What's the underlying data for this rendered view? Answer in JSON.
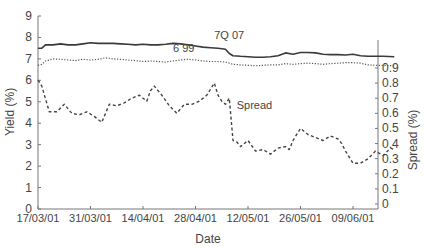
{
  "chart_data": {
    "type": "line",
    "title": "",
    "xlabel": "Date",
    "ylabel": "Yield (%)",
    "y2label": "Spread (%)",
    "ylim": [
      0,
      9
    ],
    "y2lim": [
      0,
      0.9
    ],
    "yticks": [
      "0",
      "1",
      "2",
      "3",
      "4",
      "5",
      "6",
      "7",
      "8",
      "9"
    ],
    "y2ticks": [
      "0",
      "0.1",
      "0.2",
      "0.3",
      "0.4",
      "0.5",
      "0.6",
      "0.7",
      "0.8",
      "0.9"
    ],
    "xticks": [
      "17/03/01",
      "31/03/01",
      "14/04/01",
      "28/04/01",
      "12/05/01",
      "26/05/01",
      "09/06/01"
    ],
    "x_day_range": [
      0,
      95
    ],
    "grid": false,
    "legend_position": "inline labels",
    "series": [
      {
        "name": "7Q 07",
        "axis": "left",
        "style": "solid",
        "label_pos": {
          "day": 47,
          "value": 7.95
        },
        "x": [
          0,
          1,
          2,
          4,
          6,
          8,
          10,
          12,
          14,
          16,
          18,
          20,
          22,
          24,
          26,
          28,
          30,
          32,
          34,
          36,
          38,
          40,
          42,
          44,
          46,
          48,
          50,
          51,
          52,
          54,
          56,
          58,
          60,
          62,
          64,
          66,
          68,
          70,
          72,
          74,
          76,
          78,
          80,
          82,
          84,
          86,
          88,
          90,
          92,
          95
        ],
        "values": [
          7.5,
          7.5,
          7.65,
          7.65,
          7.7,
          7.65,
          7.65,
          7.7,
          7.75,
          7.72,
          7.72,
          7.72,
          7.7,
          7.68,
          7.65,
          7.68,
          7.65,
          7.65,
          7.68,
          7.72,
          7.7,
          7.65,
          7.6,
          7.55,
          7.52,
          7.5,
          7.45,
          7.25,
          7.15,
          7.12,
          7.1,
          7.08,
          7.08,
          7.1,
          7.15,
          7.28,
          7.22,
          7.3,
          7.3,
          7.28,
          7.22,
          7.2,
          7.2,
          7.18,
          7.22,
          7.15,
          7.12,
          7.12,
          7.12,
          7.1
        ]
      },
      {
        "name": "6 99",
        "axis": "left",
        "style": "dotted",
        "label_pos": {
          "day": 36,
          "value": 7.3
        },
        "x": [
          0,
          1,
          2,
          4,
          6,
          8,
          10,
          12,
          14,
          16,
          18,
          20,
          22,
          24,
          26,
          28,
          30,
          32,
          34,
          36,
          38,
          40,
          42,
          44,
          46,
          48,
          50,
          51,
          52,
          54,
          56,
          58,
          60,
          62,
          64,
          66,
          68,
          70,
          72,
          74,
          76,
          78,
          80,
          82,
          84,
          86,
          88,
          90,
          92,
          95
        ],
        "values": [
          6.7,
          6.75,
          6.9,
          7.0,
          6.98,
          6.95,
          6.92,
          6.98,
          6.95,
          6.98,
          7.05,
          7.0,
          6.98,
          6.95,
          6.92,
          6.88,
          6.9,
          6.88,
          6.85,
          6.9,
          6.95,
          6.98,
          6.95,
          6.9,
          6.88,
          6.88,
          6.85,
          6.8,
          6.75,
          6.72,
          6.7,
          6.68,
          6.7,
          6.72,
          6.72,
          6.78,
          6.75,
          6.78,
          6.8,
          6.78,
          6.75,
          6.78,
          6.8,
          6.82,
          6.82,
          6.8,
          6.72,
          6.7,
          6.7,
          6.68
        ]
      },
      {
        "name": "Spread",
        "axis": "right",
        "style": "dashed",
        "label_pos": {
          "day": 53,
          "value": 0.63
        },
        "x": [
          0,
          1,
          3,
          5,
          7,
          9,
          11,
          13,
          15,
          17,
          18,
          19,
          21,
          23,
          25,
          27,
          29,
          30,
          31,
          33,
          35,
          37,
          39,
          41,
          43,
          45,
          47,
          48,
          49,
          50,
          51,
          52,
          53,
          54,
          56,
          58,
          60,
          62,
          64,
          66,
          67,
          68,
          70,
          72,
          74,
          76,
          78,
          80,
          81,
          82,
          84,
          86,
          88,
          90,
          92,
          94,
          95
        ],
        "values": [
          0.82,
          0.78,
          0.61,
          0.61,
          0.66,
          0.6,
          0.59,
          0.61,
          0.58,
          0.54,
          0.6,
          0.66,
          0.65,
          0.67,
          0.7,
          0.72,
          0.68,
          0.75,
          0.78,
          0.72,
          0.65,
          0.6,
          0.66,
          0.66,
          0.68,
          0.72,
          0.8,
          0.72,
          0.68,
          0.66,
          0.7,
          0.42,
          0.41,
          0.38,
          0.42,
          0.35,
          0.36,
          0.33,
          0.37,
          0.38,
          0.36,
          0.42,
          0.5,
          0.46,
          0.44,
          0.42,
          0.45,
          0.43,
          0.4,
          0.35,
          0.27,
          0.27,
          0.3,
          0.35,
          0.32,
          0.37,
          0.36
        ]
      }
    ]
  }
}
